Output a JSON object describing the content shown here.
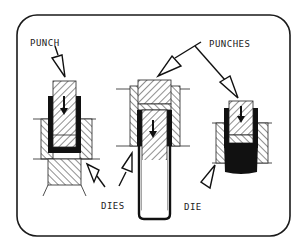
{
  "diagram": {
    "labels": {
      "punch": "PUNCH",
      "punches": "PUNCHES",
      "dies": "DIES",
      "die": "DIE"
    },
    "colors": {
      "ink": "#1a1a1a",
      "background": "#ffffff"
    },
    "assemblies": [
      {
        "name": "left",
        "description": "shallow draw: punch inside die, cup bottom blackened"
      },
      {
        "name": "center",
        "description": "deep draw: punch in die, elongated open-bottom cup"
      },
      {
        "name": "right",
        "description": "punch in die with solid black workpiece below"
      }
    ]
  }
}
